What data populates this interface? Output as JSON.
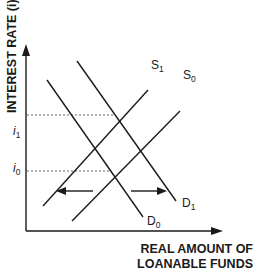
{
  "diagram": {
    "y_axis_label": "INTEREST RATE (i)",
    "x_axis_label_line1": "REAL AMOUNT OF",
    "x_axis_label_line2": "LOANABLE FUNDS",
    "ticks": [
      {
        "base": "i",
        "sub": "1"
      },
      {
        "base": "i",
        "sub": "0"
      }
    ],
    "curves": {
      "S1": {
        "base": "S",
        "sub": "1"
      },
      "S0": {
        "base": "S",
        "sub": "0"
      },
      "D0": {
        "base": "D",
        "sub": "0"
      },
      "D1": {
        "base": "D",
        "sub": "1"
      }
    },
    "arrows": [
      {
        "direction": "left"
      },
      {
        "direction": "right"
      }
    ],
    "colors": {
      "line": "#1a1a1a",
      "dashed": "#555555"
    }
  }
}
